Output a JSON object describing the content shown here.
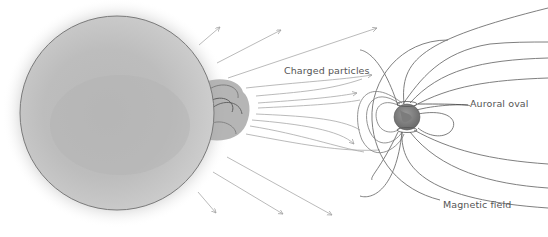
{
  "diagram": {
    "labels": {
      "charged_particles": "Charged particles",
      "auroral_oval": "Auroral oval",
      "magnetic_field": "Magnetic field"
    },
    "elements": {
      "sun": "sun",
      "solar_flare": "solar-prominence",
      "earth": "earth",
      "particle_arrows": "solar-wind-arrows",
      "field_lines": "magnetosphere-field-lines"
    },
    "colors": {
      "background": "#ffffff",
      "sun_fill": "#c4c4c4",
      "sun_outline": "#7a7a7a",
      "line": "#9a9a9a",
      "field_line": "#6e6e6e",
      "earth_fill": "#8a8a8a",
      "text": "#555555"
    }
  }
}
